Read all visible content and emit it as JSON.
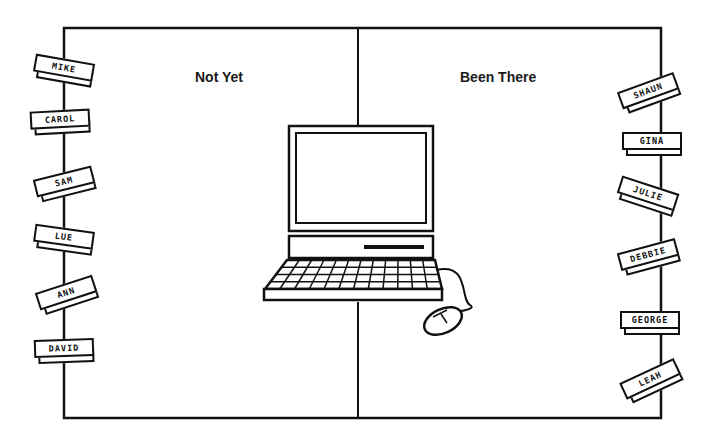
{
  "columns": {
    "left": {
      "heading": "Not Yet",
      "names": [
        "MIKE",
        "CAROL",
        "SAM",
        "LUE",
        "ANN",
        "DAVID"
      ]
    },
    "right": {
      "heading": "Been There",
      "names": [
        "SHAUN",
        "GINA",
        "JULIE",
        "DEBBIE",
        "GEORGE",
        "LEAH"
      ]
    }
  },
  "center_image": "computer-with-keyboard-and-mouse",
  "colors": {
    "ink": "#111111",
    "background": "#ffffff"
  }
}
